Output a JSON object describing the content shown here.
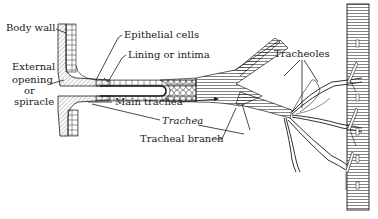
{
  "figure": {
    "labels": {
      "body_wall": "Body wall",
      "epithelial_cells": "Epithelial cells",
      "lining_or_intima": "Lining or intima",
      "external_opening_line1": "External",
      "external_opening_line2": "opening",
      "external_opening_line3": "or",
      "external_opening_line4": "spiracle",
      "main_trachea": "Main trachea",
      "trachea": "Trachea",
      "tracheal_branch": "Tracheal branch",
      "tracheoles": "Tracheoles"
    },
    "colors": {
      "ink": "#1a1a1a",
      "background": "#ffffff",
      "hatch": "#8a8a8a"
    }
  }
}
